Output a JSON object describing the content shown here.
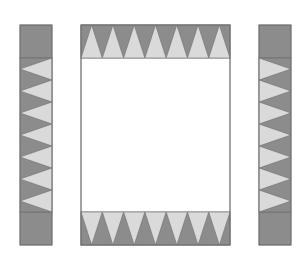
{
  "diagram": {
    "colors": {
      "dark": "#8c8c8c",
      "light": "#dadada",
      "stroke": "#6f6f6f",
      "panel_fill": "#ffffff",
      "background": "#ffffff"
    },
    "pieces": [
      {
        "id": "left-strip",
        "x": 20,
        "y": 25,
        "w": 32,
        "h": 220,
        "cap": 33,
        "triangles": 7,
        "light_apex": "left"
      },
      {
        "id": "center-panel",
        "x": 81,
        "y": 25,
        "w": 149,
        "h": 220,
        "band": 33,
        "triangles": 7
      },
      {
        "id": "right-strip",
        "x": 259,
        "y": 25,
        "w": 32,
        "h": 220,
        "cap": 33,
        "triangles": 7,
        "light_apex": "right"
      }
    ]
  }
}
